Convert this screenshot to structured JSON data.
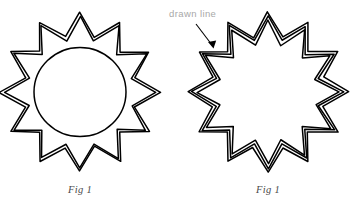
{
  "canvas": {
    "width": 355,
    "height": 204,
    "background_color": "#ffffff",
    "stroke_color": "#000000"
  },
  "annotation": {
    "label": "drawn line",
    "color": "#a8a8a8",
    "arrow_color": "#000000"
  },
  "figures": [
    {
      "id": "left",
      "caption": "Fig 1",
      "shape": "12-point-star",
      "star_points": 12,
      "outline_count": 2,
      "has_inner_circle": true,
      "center": {
        "x": 80,
        "y": 92
      },
      "outer_radius": 80,
      "inner_radius": 57,
      "outline_offsets": [
        0,
        4
      ],
      "circle_radius": 46,
      "stroke_color": "#000000",
      "stroke_width": 1.5,
      "caption_position": {
        "x": 80,
        "y": 193
      }
    },
    {
      "id": "right",
      "caption": "Fig 1",
      "shape": "12-point-star",
      "star_points": 12,
      "outline_count": 3,
      "has_inner_circle": false,
      "center": {
        "x": 268,
        "y": 92
      },
      "outer_radius": 80,
      "inner_radius": 57,
      "outline_offsets": [
        0,
        4,
        8
      ],
      "stroke_color": "#000000",
      "stroke_width": 1.5,
      "caption_position": {
        "x": 268,
        "y": 193
      }
    }
  ]
}
